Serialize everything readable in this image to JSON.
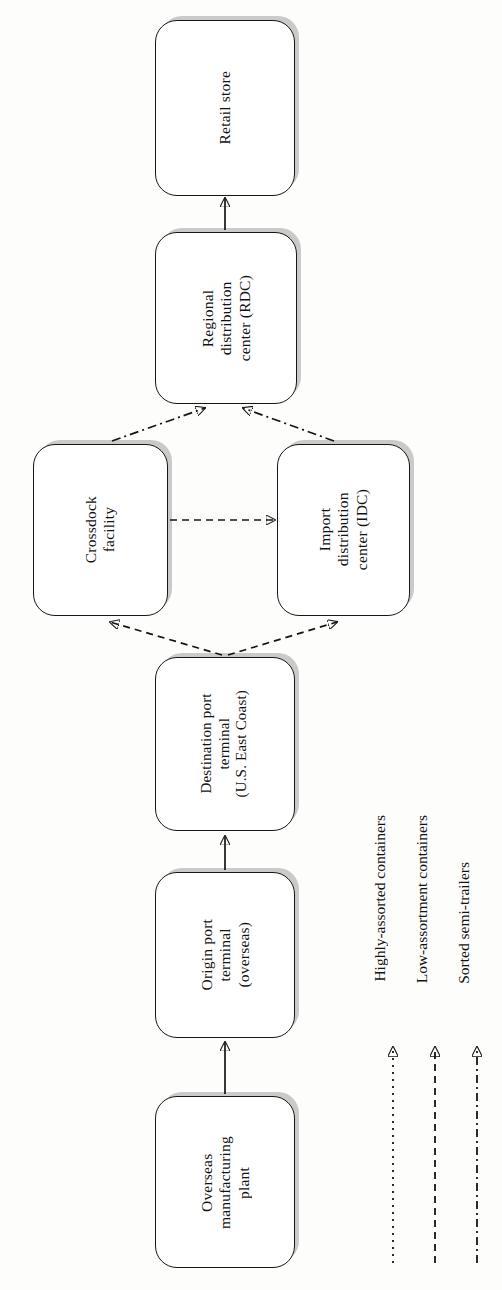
{
  "diagram": {
    "orientation": "rotated-90",
    "nodes": [
      {
        "id": "retail-store",
        "label": "Retail store"
      },
      {
        "id": "rdc",
        "label": "Regional\ndistribution\ncenter (RDC)"
      },
      {
        "id": "crossdock",
        "label": "Crossdock\nfacility"
      },
      {
        "id": "idc",
        "label": "Import\ndistribution\ncenter (IDC)"
      },
      {
        "id": "destination-port",
        "label": "Destination port\nterminal\n(U.S. East Coast)"
      },
      {
        "id": "origin-port",
        "label": "Origin port\nterminal\n(overseas)"
      },
      {
        "id": "plant",
        "label": "Overseas\nmanufacturing\nplant"
      }
    ],
    "edges": [
      {
        "from": "plant",
        "to": "origin-port",
        "style": "solid"
      },
      {
        "from": "origin-port",
        "to": "destination-port",
        "style": "solid"
      },
      {
        "from": "destination-port",
        "to": "crossdock",
        "style": "dashed"
      },
      {
        "from": "destination-port",
        "to": "idc",
        "style": "dashed"
      },
      {
        "from": "crossdock",
        "to": "idc",
        "style": "dashed"
      },
      {
        "from": "crossdock",
        "to": "rdc",
        "style": "dash-dot"
      },
      {
        "from": "idc",
        "to": "rdc",
        "style": "dash-dot"
      },
      {
        "from": "rdc",
        "to": "retail-store",
        "style": "solid"
      }
    ]
  },
  "legend": {
    "items": [
      {
        "id": "highly-assorted",
        "label": "Highly-assorted containers",
        "style": "dotted"
      },
      {
        "id": "low-assortment",
        "label": "Low-assortment containers",
        "style": "dashed"
      },
      {
        "id": "sorted-semi-trailers",
        "label": "Sorted semi-trailers",
        "style": "dash-dot"
      }
    ]
  },
  "colors": {
    "stroke": "#151515",
    "shadow": "#8c8c8c",
    "background": "#ffffff"
  }
}
